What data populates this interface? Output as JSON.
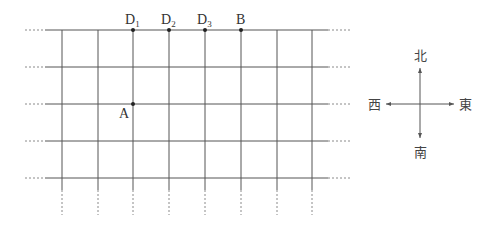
{
  "diagram": {
    "type": "street-grid-map",
    "grid": {
      "vertical_x": [
        62,
        98,
        133,
        169,
        205,
        241,
        277,
        312
      ],
      "horizontal_y": [
        30,
        67,
        104,
        141,
        178
      ],
      "solid_x_range": [
        45,
        328
      ],
      "dashed_x_left": [
        25,
        45
      ],
      "dashed_x_right": [
        328,
        352
      ],
      "solid_y_range": [
        30,
        190
      ],
      "dashed_y_bottom": [
        190,
        215
      ],
      "line_color": "#555555"
    },
    "points": [
      {
        "id": "D1",
        "letter": "D",
        "sub": "1",
        "x": 133,
        "y": 30
      },
      {
        "id": "D2",
        "letter": "D",
        "sub": "2",
        "x": 169,
        "y": 30
      },
      {
        "id": "D3",
        "letter": "D",
        "sub": "3",
        "x": 205,
        "y": 30
      },
      {
        "id": "B",
        "letter": "B",
        "sub": "",
        "x": 241,
        "y": 30
      },
      {
        "id": "A",
        "letter": "A",
        "sub": "",
        "x": 133,
        "y": 104
      }
    ],
    "labels": {
      "D1": {
        "letter": "D",
        "sub": "1"
      },
      "D2": {
        "letter": "D",
        "sub": "2"
      },
      "D3": {
        "letter": "D",
        "sub": "3"
      },
      "B": "B",
      "A": "A"
    },
    "compass": {
      "north": "北",
      "south": "南",
      "west": "西",
      "east": "東",
      "center_x": 420,
      "center_y": 104
    }
  }
}
